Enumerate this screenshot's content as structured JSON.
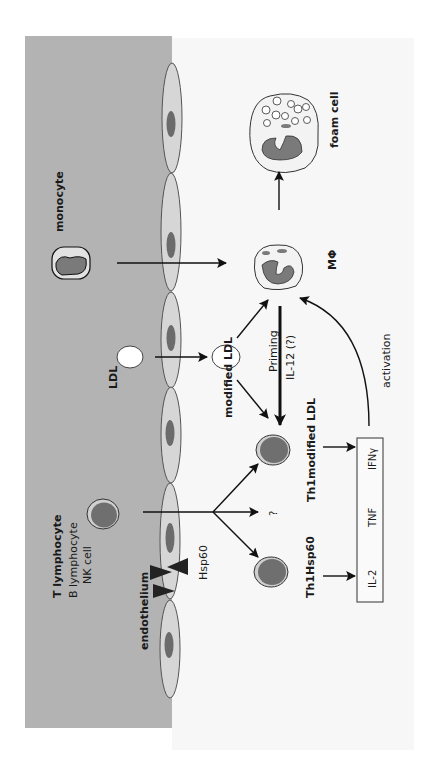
{
  "figure": {
    "colors": {
      "lumen": "#b3b3b3",
      "tissue": "#f7f7f7",
      "endothelium_fill": "#d6d6d6",
      "nucleus": "#6b6b6b",
      "arrow": "#111111"
    }
  },
  "labels": {
    "monocyte": "monocyte",
    "ldl": "LDL",
    "t_lymphocyte": "T lymphocyte",
    "b_lymphocyte": "B lymphocyte",
    "nk_cell": "NK cell",
    "endothelium": "endothelium",
    "hsp60": "Hsp60",
    "modified_ldl": "modified LDL",
    "macrophage": "MΦ",
    "foam_cell": "foam cell",
    "priming": "Priming",
    "il12": "IL-12 (?)",
    "activation": "activation",
    "question": "?",
    "th1_modified_ldl": "Th1modified LDL",
    "th1_hsp60": "Th1Hsp60",
    "cytokine_box": {
      "items": [
        "IL-2",
        "TNF",
        "IFNγ"
      ]
    }
  }
}
